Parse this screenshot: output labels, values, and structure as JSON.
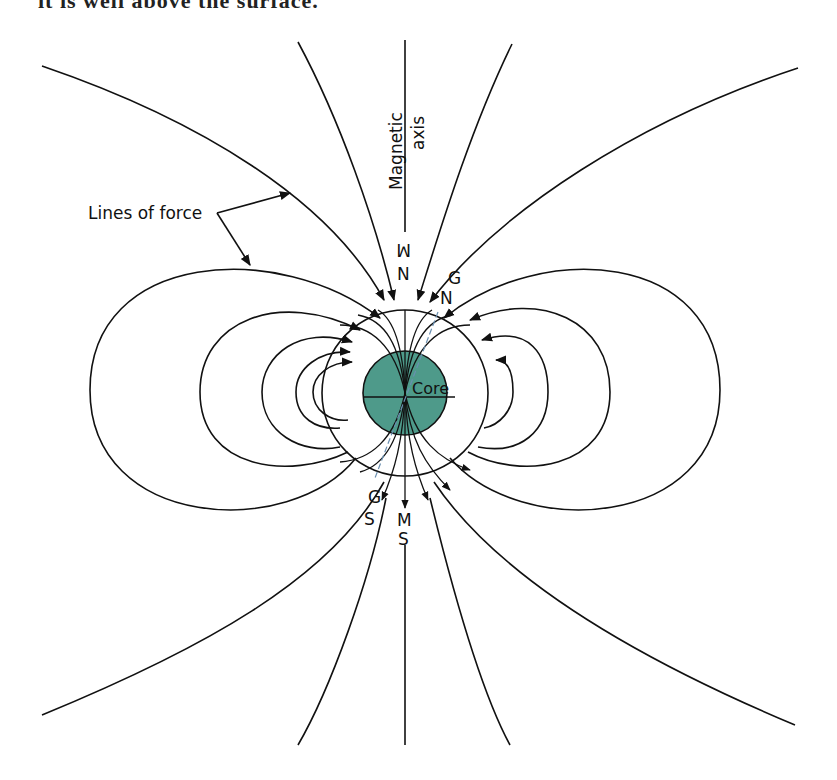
{
  "caption_fragment": "it is well above the surface.",
  "diagram": {
    "labels": {
      "magnetic_axis_line1": "Magnetic",
      "magnetic_axis_line2": "axis",
      "lines_of_force": "Lines of force",
      "core": "Core",
      "magnetic_north_m": "M",
      "magnetic_north_n": "N",
      "geographic_north_g": "G",
      "geographic_north_n": "N",
      "magnetic_south_m": "M",
      "magnetic_south_s": "S",
      "geographic_south_g": "G",
      "geographic_south_s": "S"
    },
    "colors": {
      "core_fill": "#4e9a8a",
      "line": "#111111",
      "geographic_axis": "#6a8fb0",
      "background": "#ffffff"
    }
  }
}
